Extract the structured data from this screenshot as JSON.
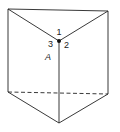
{
  "diagram": {
    "type": "triangular-prism",
    "labels": {
      "edge1": "1",
      "edge2": "2",
      "edge3": "3",
      "vertex": "A"
    },
    "colors": {
      "stroke": "#222222",
      "background": "#ffffff"
    }
  }
}
